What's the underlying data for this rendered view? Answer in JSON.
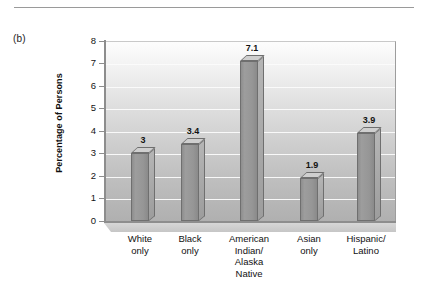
{
  "panel": {
    "label": "(b)"
  },
  "chart_data": {
    "type": "bar",
    "title": "",
    "xlabel": "",
    "ylabel": "Percentage of Persons",
    "ylim": [
      0,
      8
    ],
    "ytick_step": 1,
    "yticks": [
      "8",
      "7",
      "6",
      "5",
      "4",
      "3",
      "2",
      "1",
      "0"
    ],
    "grid": true,
    "legend": "none",
    "categories": [
      "White\nonly",
      "Black\nonly",
      "American\nIndian/\nAlaska\nNative",
      "Asian\nonly",
      "Hispanic/\nLatino"
    ],
    "category_lines": [
      [
        "White",
        "only"
      ],
      [
        "Black",
        "only"
      ],
      [
        "American",
        "Indian/",
        "Alaska",
        "Native"
      ],
      [
        "Asian",
        "only"
      ],
      [
        "Hispanic/",
        "Latino"
      ]
    ],
    "values": [
      3,
      3.4,
      7.1,
      1.9,
      3.9
    ],
    "value_labels": [
      "3",
      "3.4",
      "7.1",
      "1.9",
      "3.9"
    ],
    "bar_color": "#969696",
    "bar_edge_color": "#6f6f6f",
    "bar_top_color": "#cfcfcf",
    "bar_side_color": "#aaaaaa",
    "plot_background_top": "#fdfdfd",
    "plot_background_bottom": "#b0b0b0",
    "gridline_color": "#fbfbfb",
    "axis_color": "#8d8d8d",
    "text_color": "#121212"
  }
}
